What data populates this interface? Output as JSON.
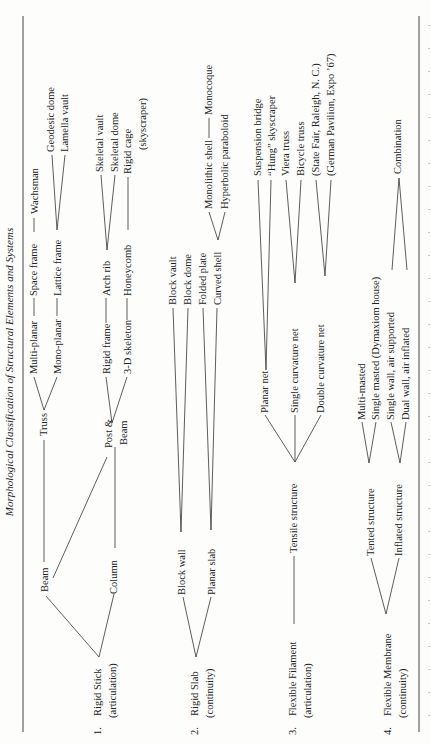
{
  "title": "Morphological Classification of Structural Elements and Systems",
  "groups": [
    {
      "number": "1.",
      "name": "Rigid Stick",
      "qualifier": "(articulation)",
      "elements": {
        "beam": "Beam",
        "column": "Column",
        "truss": "Truss",
        "post_beam_1": "Post &",
        "post_beam_2": "Beam",
        "multi_planar": "Multi-planar",
        "mono_planar": "Mono-planar",
        "rigid_frame": "Rigid frame",
        "three_d_skeleton": "3-D skeleton",
        "space_frame": "Space frame",
        "lattice_frame": "Lattice frame",
        "arch_rib": "Arch rib",
        "honeycomb": "Honeycomb",
        "wachsman": "Wachsman",
        "geodesic_dome": "Geodesic dome",
        "lamella_vault": "Lamella vault",
        "skeletal_vault": "Skeletal vault",
        "skeletal_dome": "Skeletal dome",
        "rigid_cage": "Rigid cage",
        "rigid_cage_note": "(skyscraper)"
      }
    },
    {
      "number": "2.",
      "name": "Rigid Slab",
      "qualifier": "(continuity)",
      "elements": {
        "block_wall": "Block wall",
        "planar_slab": "Planar slab",
        "block_vault": "Block vault",
        "block_dome": "Block dome",
        "folded_plate": "Folded plate",
        "curved_shell": "Curved shell",
        "monolithic_shell": "Monolithic shell",
        "hyperbolic_paraboloid": "Hyperbolic paraboloid",
        "monocoque": "Monocoque"
      }
    },
    {
      "number": "3.",
      "name": "Flexible Filament",
      "qualifier": "(articulation)",
      "elements": {
        "tensile_structure": "Tensile structure",
        "planar_net": "Planar net",
        "single_curvature_net": "Single curvature net",
        "double_curvature_net": "Double curvature net",
        "suspension_bridge": "Suspension bridge",
        "hung_skyscraper": "“Hung” skyscraper",
        "viera_truss": "Viera truss",
        "bicycle_truss": "Bicycle truss",
        "state_fair": "(State Fair, Raleigh, N. C.)",
        "german_pavilion": "(German Pavilion, Expo ’67)"
      }
    },
    {
      "number": "4.",
      "name": "Flexible Membrane",
      "qualifier": "(continuity)",
      "elements": {
        "tented_structure": "Tented structure",
        "inflated_structure": "Inflated structure",
        "multi_masted": "Multi-masted",
        "single_masted": "Single masted (Dymaxiom house)",
        "single_wall": "Single wall, air supported",
        "dual_wall": "Dual wall, air inflated",
        "combination": "Combination"
      }
    }
  ]
}
